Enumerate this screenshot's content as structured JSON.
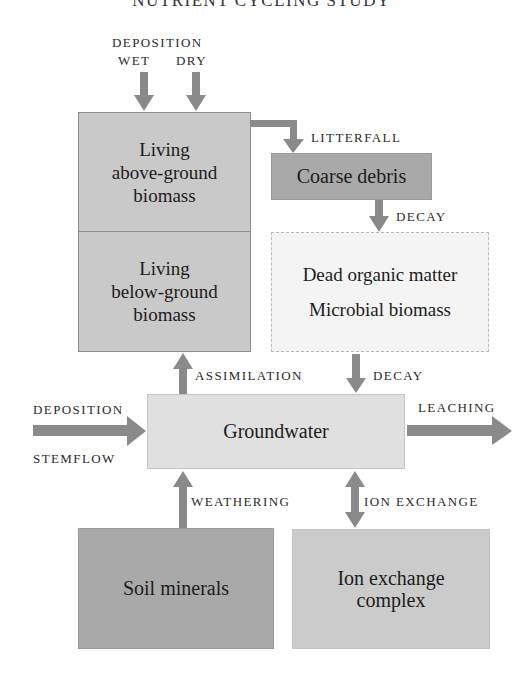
{
  "title": "NUTRIENT CYCLING STUDY",
  "colors": {
    "arrow": "#8a8a8a",
    "box_mid": "#c9c9c9",
    "box_dark": "#a9a9a9",
    "box_light": "#f4f4f4",
    "box_pale": "#e0e0e0"
  },
  "boxes": {
    "above_ground": {
      "lines": [
        "Living",
        "above-ground",
        "biomass"
      ]
    },
    "below_ground": {
      "lines": [
        "Living",
        "below-ground",
        "biomass"
      ]
    },
    "coarse_debris": {
      "lines": [
        "Coarse debris"
      ]
    },
    "dead_organic": {
      "lines": [
        "Dead organic matter",
        "Microbial biomass"
      ]
    },
    "groundwater": {
      "lines": [
        "Groundwater"
      ]
    },
    "soil_minerals": {
      "lines": [
        "Soil minerals"
      ]
    },
    "ion_exchange": {
      "lines": [
        "Ion exchange",
        "complex"
      ]
    }
  },
  "flows": {
    "deposition_top": "DEPOSITION",
    "wet": "WET",
    "dry": "DRY",
    "litterfall": "LITTERFALL",
    "decay_upper": "DECAY",
    "assimilation": "ASSIMILATION",
    "decay_lower": "DECAY",
    "deposition_left": "DEPOSITION",
    "stemflow": "STEMFLOW",
    "leaching": "LEACHING",
    "weathering": "WEATHERING",
    "ion_exchange": "ION EXCHANGE"
  }
}
